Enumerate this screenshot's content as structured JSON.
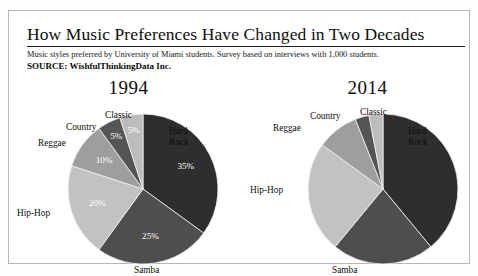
{
  "header": {
    "title": "How Music Preferences Have Changed in Two Decades",
    "subtitle": "Music styles preferred by University of Miami students. Survey based on interviews with 1,000 students.",
    "source": "SOURCE: WishfulThinkingData Inc."
  },
  "chart_data": [
    {
      "type": "pie",
      "title": "1994",
      "categories": [
        "Hard Rock",
        "Samba",
        "Hip-Hop",
        "Reggae",
        "Country",
        "Classic"
      ],
      "values": [
        35,
        25,
        20,
        10,
        5,
        5
      ],
      "value_labels": [
        "35%",
        "25%",
        "20%",
        "10%",
        "5%",
        "5%"
      ],
      "show_value_labels": true,
      "colors": [
        "#2e2e2e",
        "#4e4e4e",
        "#c2c2c2",
        "#9e9e9e",
        "#555555",
        "#bcbcbc"
      ],
      "start_angle_deg": 0,
      "direction": "clockwise",
      "ylabel": "",
      "xlabel": "",
      "legend": "outside-labels"
    },
    {
      "type": "pie",
      "title": "2014",
      "categories": [
        "Hard Rock",
        "Samba",
        "Hip-Hop",
        "Reggae",
        "Country",
        "Classic"
      ],
      "values": [
        39,
        22,
        24,
        9,
        3,
        3
      ],
      "value_labels": [
        "",
        "",
        "",
        "",
        "",
        ""
      ],
      "show_value_labels": false,
      "colors": [
        "#2e2e2e",
        "#4e4e4e",
        "#c2c2c2",
        "#9e9e9e",
        "#555555",
        "#bcbcbc"
      ],
      "start_angle_deg": 0,
      "direction": "clockwise",
      "ylabel": "",
      "xlabel": "",
      "legend": "outside-labels"
    }
  ],
  "labels_1994": {
    "hard_rock": "Hard\nRock",
    "hard_rock_line1": "Hard",
    "hard_rock_line2": "Rock",
    "samba": "Samba",
    "hip_hop": "Hip-Hop",
    "reggae": "Reggae",
    "country": "Country",
    "classic": "Classic"
  },
  "labels_2014": {
    "hard_rock_line1": "Hard",
    "hard_rock_line2": "Rock",
    "samba": "Samba",
    "hip_hop": "Hip-Hop",
    "reggae": "Reggae",
    "country": "Country",
    "classic": "Classic"
  }
}
